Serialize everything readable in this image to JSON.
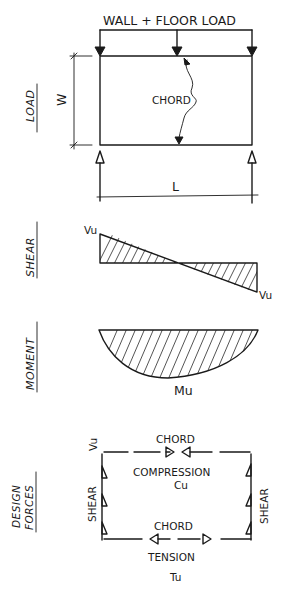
{
  "diagram": {
    "load_panel": {
      "side_label": "LOAD",
      "load_title": "WALL + FLOOR LOAD",
      "chord_label": "CHORD",
      "width_label": "W",
      "length_label": "L"
    },
    "shear_panel": {
      "side_label": "SHEAR",
      "left_value": "Vu",
      "right_value": "Vu"
    },
    "moment_panel": {
      "side_label": "MOMENT",
      "max_value": "Mu"
    },
    "design_forces_panel": {
      "side_label_line1": "DESIGN",
      "side_label_line2": "FORCES",
      "corner_label": "Vu",
      "top_chord_label": "CHORD",
      "top_force_type": "COMPRESSION",
      "top_force_symbol": "Cu",
      "bottom_chord_label": "CHORD",
      "bottom_force_type": "TENSION",
      "bottom_force_symbol": "Tu",
      "left_edge_label": "SHEAR",
      "right_edge_label": "SHEAR"
    }
  }
}
